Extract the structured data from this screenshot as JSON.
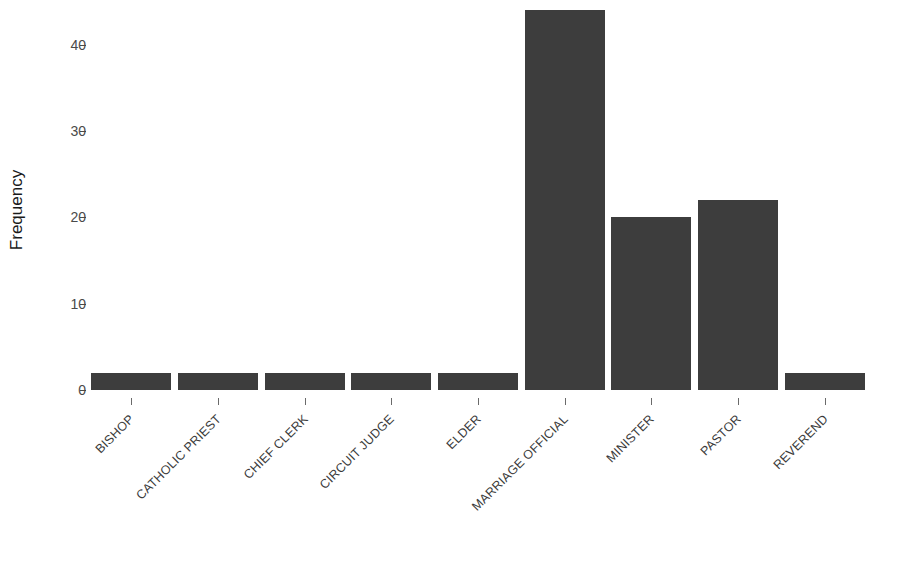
{
  "chart_data": {
    "type": "bar",
    "title": "",
    "clipped_top_text": "",
    "xlabel": "",
    "ylabel": "Frequency",
    "categories": [
      "BISHOP",
      "CATHOLIC PRIEST",
      "CHIEF CLERK",
      "CIRCUIT JUDGE",
      "ELDER",
      "MARRIAGE OFFICIAL",
      "MINISTER",
      "PASTOR",
      "REVEREND"
    ],
    "values": [
      2,
      2,
      2,
      2,
      2,
      44,
      20,
      22,
      2
    ],
    "ylim": [
      0,
      44
    ],
    "yticks": [
      0,
      10,
      20,
      30,
      40
    ],
    "ytick_labels": [
      "0",
      "10",
      "20",
      "30",
      "40"
    ],
    "grid": false,
    "legend": null,
    "bar_color": "#3d3d3d",
    "axis_text_color": "#3a3a3a",
    "background_color": "#ffffff",
    "label_rotation_degrees": 45
  },
  "axes": {
    "y_title": "Frequency"
  }
}
